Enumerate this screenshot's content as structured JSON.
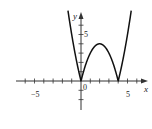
{
  "chart_data": {
    "type": "line",
    "title": "",
    "function": "y = |x^2 - 4x|",
    "xlabel": "x",
    "ylabel": "y",
    "xlim": [
      -6.8,
      7.2
    ],
    "ylim": [
      -3,
      7.2
    ],
    "x_tick_labels": [
      {
        "value": -5,
        "label": "−5"
      },
      {
        "value": 0,
        "label": "0"
      },
      {
        "value": 5,
        "label": "5"
      }
    ],
    "y_tick_labels": [
      {
        "value": 5,
        "label": "5"
      }
    ],
    "x_ticks": [
      -6,
      -5,
      -4,
      -3,
      -2,
      -1,
      1,
      2,
      3,
      4,
      5,
      6
    ],
    "y_ticks": [
      -2,
      -1,
      1,
      2,
      3,
      4,
      5,
      6
    ],
    "grid": false,
    "legend": null,
    "series": [
      {
        "name": "y = |x^2 - 4x|",
        "x": [
          -1.4,
          -1.0,
          -0.5,
          0,
          0.5,
          1,
          1.5,
          2,
          2.5,
          3,
          3.5,
          4,
          4.5,
          5,
          5.4
        ],
        "values": [
          7.56,
          5.0,
          2.25,
          0,
          1.75,
          3,
          3.75,
          4,
          3.75,
          3,
          1.75,
          0,
          2.25,
          5.0,
          7.56
        ]
      }
    ],
    "annotations": [
      {
        "text": "0",
        "at": [
          0,
          0
        ]
      },
      {
        "text": "x",
        "position": "end of x-axis"
      },
      {
        "text": "y",
        "position": "top of y-axis"
      }
    ]
  },
  "labels": {
    "x_axis": "x",
    "y_axis": "y",
    "origin": "0",
    "x_neg5": "−5",
    "x_pos5": "5",
    "y_pos5": "5"
  }
}
